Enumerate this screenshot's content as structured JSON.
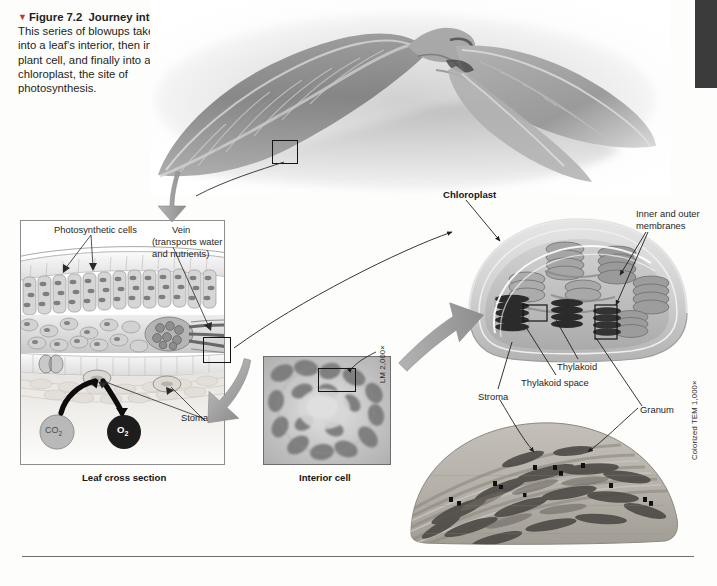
{
  "figure": {
    "marker": "▼",
    "number": "Figure 7.2",
    "title": "Journey into a leaf.",
    "body": " This series of blowups takes you into a leaf's interior, then into a plant cell, and finally into a chloroplast, the site of photosynthesis."
  },
  "panels": {
    "leaf_cross_section_title": "Leaf cross section",
    "interior_cell_title": "Interior cell"
  },
  "labels": {
    "photosynthetic_cells": "Photosynthetic cells",
    "vein": "Vein",
    "vein_sub1": "(transports water",
    "vein_sub2": "and nutrients)",
    "stomata": "Stomata",
    "co2": "CO",
    "co2_sub": "2",
    "o2": "O",
    "o2_sub": "2",
    "chloroplast": "Chloroplast",
    "inner_outer_1": "Inner and outer",
    "inner_outer_2": "membranes",
    "thylakoid": "Thylakoid",
    "thylakoid_space": "Thylakoid space",
    "stroma": "Stroma",
    "granum": "Granum"
  },
  "magnifications": {
    "lm": "LM 2,000×",
    "tem": "Colorized TEM 1,000×"
  },
  "colors": {
    "caption_marker": "#c0392b",
    "chapter_tab": "#3b3b3b",
    "co2_circle": "#b9b9b9",
    "o2_circle": "#1d1d1d",
    "arrow_gray": "#9a9a9a",
    "text": "#1f1f1f"
  }
}
